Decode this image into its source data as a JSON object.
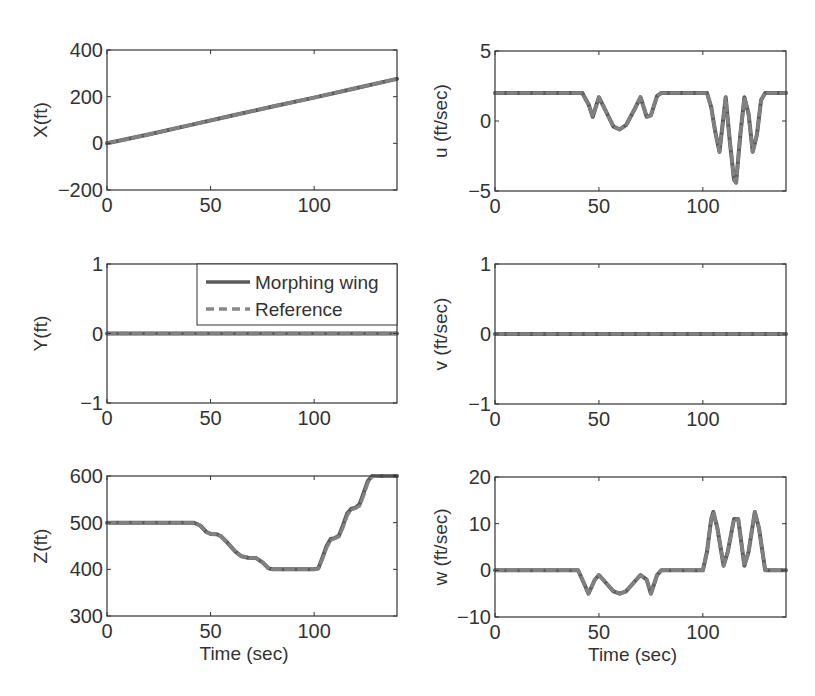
{
  "figure": {
    "legend": {
      "entries": [
        {
          "label": "Morphing wing",
          "style": "solid"
        },
        {
          "label": "Reference",
          "style": "dashed"
        }
      ]
    },
    "line_color": "#5a5a5a",
    "ref_color": "#888888",
    "axis_color": "#333333"
  },
  "chart_data": [
    {
      "type": "line",
      "id": "X",
      "title": "",
      "xlabel": "",
      "ylabel": "X(ft)",
      "xlim": [
        0,
        140
      ],
      "ylim": [
        -200,
        400
      ],
      "xticks": [
        0,
        50,
        100
      ],
      "yticks": [
        -200,
        0,
        200,
        400
      ],
      "xticklabels": [
        "0",
        "50",
        "100"
      ],
      "yticklabels": [
        "−200",
        "0",
        "200",
        "400"
      ],
      "grid": false,
      "series": [
        {
          "name": "Morphing wing",
          "x": [
            0,
            20,
            40,
            60,
            80,
            100,
            120,
            140
          ],
          "y": [
            0,
            38,
            78,
            118,
            158,
            196,
            236,
            276
          ]
        },
        {
          "name": "Reference",
          "x": [
            0,
            20,
            40,
            60,
            80,
            100,
            120,
            140
          ],
          "y": [
            0,
            38,
            78,
            118,
            158,
            196,
            236,
            276
          ]
        }
      ]
    },
    {
      "type": "line",
      "id": "u",
      "title": "",
      "xlabel": "",
      "ylabel": "u (ft/sec)",
      "xlim": [
        0,
        140
      ],
      "ylim": [
        -5,
        5
      ],
      "xticks": [
        0,
        50,
        100
      ],
      "yticks": [
        -5,
        0,
        5
      ],
      "xticklabels": [
        "0",
        "50",
        "100"
      ],
      "yticklabels": [
        "−5",
        "0",
        "5"
      ],
      "grid": false,
      "series": [
        {
          "name": "Morphing wing",
          "x": [
            0,
            42,
            45,
            47,
            50,
            53,
            57,
            60,
            63,
            67,
            70,
            73,
            75,
            78,
            80,
            102,
            104,
            106,
            108,
            111,
            113,
            115,
            116,
            118,
            120,
            122,
            124,
            126,
            128,
            130,
            140
          ],
          "y": [
            2,
            2,
            1.2,
            0.3,
            1.7,
            0.8,
            -0.4,
            -0.6,
            -0.3,
            0.8,
            1.7,
            0.3,
            0.4,
            1.8,
            2,
            2,
            1.0,
            -0.8,
            -2.2,
            1.7,
            -1.5,
            -4.2,
            -4.4,
            -1.0,
            1.7,
            0.5,
            -2.2,
            -1.0,
            1.5,
            2,
            2
          ]
        },
        {
          "name": "Reference",
          "x": [
            0,
            42,
            45,
            47,
            50,
            53,
            57,
            60,
            63,
            67,
            70,
            73,
            75,
            78,
            80,
            102,
            104,
            106,
            108,
            111,
            113,
            115,
            116,
            118,
            120,
            122,
            124,
            126,
            128,
            130,
            140
          ],
          "y": [
            2,
            2,
            1.2,
            0.3,
            1.7,
            0.8,
            -0.4,
            -0.6,
            -0.3,
            0.8,
            1.7,
            0.3,
            0.4,
            1.8,
            2,
            2,
            1.0,
            -0.8,
            -2.2,
            1.7,
            -1.5,
            -4.2,
            -4.4,
            -1.0,
            1.7,
            0.5,
            -2.2,
            -1.0,
            1.5,
            2,
            2
          ]
        }
      ]
    },
    {
      "type": "line",
      "id": "Y",
      "title": "",
      "xlabel": "",
      "ylabel": "Y(ft)",
      "xlim": [
        0,
        140
      ],
      "ylim": [
        -1,
        1
      ],
      "xticks": [
        0,
        50,
        100
      ],
      "yticks": [
        -1,
        0,
        1
      ],
      "xticklabels": [
        "0",
        "50",
        "100"
      ],
      "yticklabels": [
        "−1",
        "0",
        "1"
      ],
      "grid": false,
      "legend_position": "upper right",
      "series": [
        {
          "name": "Morphing wing",
          "x": [
            0,
            140
          ],
          "y": [
            0,
            0
          ]
        },
        {
          "name": "Reference",
          "x": [
            0,
            140
          ],
          "y": [
            0,
            0
          ]
        }
      ]
    },
    {
      "type": "line",
      "id": "v",
      "title": "",
      "xlabel": "",
      "ylabel": "v (ft/sec)",
      "xlim": [
        0,
        140
      ],
      "ylim": [
        -1,
        1
      ],
      "xticks": [
        0,
        50,
        100
      ],
      "yticks": [
        -1,
        0,
        1
      ],
      "xticklabels": [
        "0",
        "50",
        "100"
      ],
      "yticklabels": [
        "−1",
        "0",
        "1"
      ],
      "grid": false,
      "series": [
        {
          "name": "Morphing wing",
          "x": [
            0,
            140
          ],
          "y": [
            0,
            0
          ]
        },
        {
          "name": "Reference",
          "x": [
            0,
            140
          ],
          "y": [
            0,
            0
          ]
        }
      ]
    },
    {
      "type": "line",
      "id": "Z",
      "title": "",
      "xlabel": "Time (sec)",
      "ylabel": "Z(ft)",
      "xlim": [
        0,
        140
      ],
      "ylim": [
        300,
        600
      ],
      "xticks": [
        0,
        50,
        100
      ],
      "yticks": [
        300,
        400,
        500,
        600
      ],
      "xticklabels": [
        "0",
        "50",
        "100"
      ],
      "yticklabels": [
        "300",
        "400",
        "500",
        "600"
      ],
      "grid": false,
      "series": [
        {
          "name": "Morphing wing",
          "x": [
            0,
            42,
            45,
            48,
            50,
            53,
            55,
            58,
            62,
            65,
            68,
            72,
            75,
            78,
            80,
            100,
            102,
            104,
            106,
            108,
            110,
            112,
            114,
            116,
            118,
            120,
            122,
            124,
            126,
            128,
            130,
            140
          ],
          "y": [
            500,
            500,
            494,
            480,
            476,
            475,
            471,
            458,
            438,
            428,
            425,
            424,
            415,
            402,
            400,
            400,
            402,
            425,
            450,
            465,
            467,
            472,
            495,
            520,
            530,
            532,
            540,
            565,
            590,
            600,
            600,
            600
          ]
        },
        {
          "name": "Reference",
          "x": [
            0,
            42,
            45,
            48,
            50,
            53,
            55,
            58,
            62,
            65,
            68,
            72,
            75,
            78,
            80,
            100,
            102,
            104,
            106,
            108,
            110,
            112,
            114,
            116,
            118,
            120,
            122,
            124,
            126,
            128,
            130,
            140
          ],
          "y": [
            500,
            500,
            494,
            480,
            476,
            475,
            471,
            458,
            438,
            428,
            425,
            424,
            415,
            402,
            400,
            400,
            401,
            422,
            446,
            462,
            466,
            470,
            490,
            516,
            528,
            531,
            536,
            560,
            586,
            598,
            600,
            600
          ]
        }
      ]
    },
    {
      "type": "line",
      "id": "w",
      "title": "",
      "xlabel": "Time (sec)",
      "ylabel": "w (ft/sec)",
      "xlim": [
        0,
        140
      ],
      "ylim": [
        -10,
        20
      ],
      "xticks": [
        0,
        50,
        100
      ],
      "yticks": [
        -10,
        0,
        10,
        20
      ],
      "xticklabels": [
        "0",
        "50",
        "100"
      ],
      "yticklabels": [
        "−10",
        "0",
        "10",
        "20"
      ],
      "grid": false,
      "series": [
        {
          "name": "Morphing wing",
          "x": [
            0,
            40,
            43,
            45,
            48,
            50,
            53,
            57,
            60,
            63,
            67,
            70,
            73,
            75,
            78,
            80,
            100,
            102,
            104,
            105,
            107,
            110,
            112,
            115,
            117,
            120,
            122,
            125,
            127,
            130,
            140
          ],
          "y": [
            0,
            0,
            -3,
            -5,
            -2,
            -1,
            -2.5,
            -4.5,
            -5,
            -4.5,
            -2.5,
            -1,
            -2,
            -5,
            -1,
            0,
            0,
            4,
            11,
            12.5,
            9,
            1,
            4,
            11,
            11,
            1,
            4,
            12.5,
            9,
            0,
            0
          ]
        },
        {
          "name": "Reference",
          "x": [
            0,
            40,
            43,
            45,
            48,
            50,
            53,
            57,
            60,
            63,
            67,
            70,
            73,
            75,
            78,
            80,
            100,
            102,
            104,
            105,
            107,
            110,
            112,
            115,
            117,
            120,
            122,
            125,
            127,
            130,
            140
          ],
          "y": [
            0,
            0,
            -3,
            -5,
            -2,
            -1,
            -2.5,
            -4.5,
            -5,
            -4.5,
            -2.5,
            -1,
            -2,
            -5,
            -1,
            0,
            0,
            4,
            11,
            12.5,
            9,
            1,
            4,
            11,
            11,
            1,
            4,
            12.5,
            9,
            0,
            0
          ]
        }
      ]
    }
  ]
}
